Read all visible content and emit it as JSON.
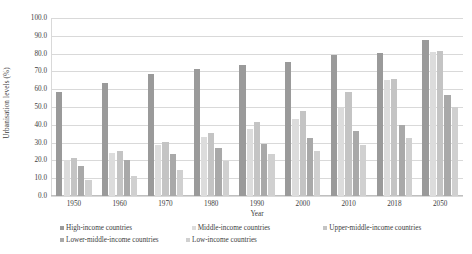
{
  "chart_data": {
    "type": "bar",
    "title": "",
    "xlabel": "Year",
    "ylabel": "Urbanisation levels (%)",
    "categories": [
      "1950",
      "1960",
      "1970",
      "1980",
      "1990",
      "2000",
      "2010",
      "2018",
      "2050"
    ],
    "ylim": [
      0,
      100
    ],
    "ytick_step": 10,
    "ytick_labels": [
      "100.0",
      "90.0",
      "80.0",
      "70.0",
      "60.0",
      "50.0",
      "40.0",
      "30.0",
      "20.0",
      "10.0",
      "0.0"
    ],
    "grid": true,
    "legend_position": "bottom",
    "series": [
      {
        "name": "High-income countries",
        "color": "#9a9a9a",
        "values": [
          58.5,
          63.5,
          68.5,
          71.5,
          73.5,
          75.5,
          79.0,
          80.5,
          87.5
        ]
      },
      {
        "name": "Middle-income countries",
        "color": "#dcdcdc",
        "values": [
          20.0,
          24.0,
          28.5,
          33.0,
          37.5,
          43.0,
          49.5,
          65.0,
          81.0
        ]
      },
      {
        "name": "Upper-middle-income countries",
        "color": "#c4c4c4",
        "values": [
          21.5,
          25.5,
          30.5,
          35.5,
          41.5,
          48.0,
          58.5,
          65.5,
          81.5
        ]
      },
      {
        "name": "Lower-middle-income countries",
        "color": "#a9a9a9",
        "values": [
          17.0,
          20.5,
          23.5,
          27.0,
          29.5,
          32.5,
          36.5,
          40.0,
          56.5
        ]
      },
      {
        "name": "Low-income countries",
        "color": "#d0d0d0",
        "values": [
          9.0,
          11.5,
          14.5,
          19.5,
          23.5,
          25.5,
          28.5,
          32.5,
          50.0
        ]
      }
    ]
  },
  "axes": {
    "ylabel": "Urbanisation levels (%)",
    "xlabel": "Year"
  }
}
